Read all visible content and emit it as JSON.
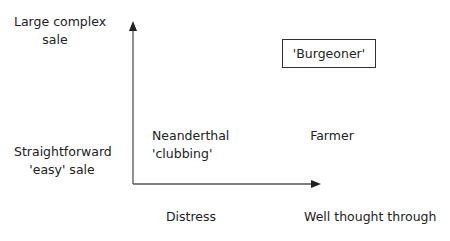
{
  "y_axis": {
    "high_label_line1": "Large complex",
    "high_label_line2": "sale",
    "low_label_line1": "Straightforward",
    "low_label_line2": "'easy' sale"
  },
  "x_axis": {
    "left_label": "Distress",
    "right_label": "Well thought through"
  },
  "quadrants": {
    "top_right": "'Burgeoner'",
    "bottom_left_line1": "Neanderthal",
    "bottom_left_line2": "'clubbing'",
    "bottom_right": "Farmer"
  },
  "colors": {
    "axis": "#333333",
    "text": "#222222"
  }
}
